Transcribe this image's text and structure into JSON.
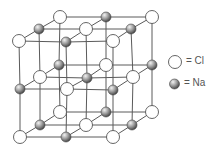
{
  "diagram": {
    "colors": {
      "line": "#555555",
      "cl_fill": "#ffffff",
      "cl_stroke": "#555555",
      "na_light": "#e8e8e8",
      "na_dark": "#555555"
    },
    "layers": [
      {
        "name": "top",
        "nodes": [
          {
            "x": 60,
            "y": 17,
            "type": "Cl"
          },
          {
            "x": 106,
            "y": 17,
            "type": "Na"
          },
          {
            "x": 152,
            "y": 17,
            "type": "Cl"
          },
          {
            "x": 39,
            "y": 29,
            "type": "Na"
          },
          {
            "x": 86,
            "y": 29,
            "type": "Cl"
          },
          {
            "x": 131,
            "y": 29,
            "type": "Na"
          },
          {
            "x": 19,
            "y": 41,
            "type": "Cl"
          },
          {
            "x": 66,
            "y": 42,
            "type": "Na"
          },
          {
            "x": 113,
            "y": 41,
            "type": "Cl"
          }
        ]
      },
      {
        "name": "middle",
        "nodes": [
          {
            "x": 59,
            "y": 65,
            "type": "Na"
          },
          {
            "x": 106,
            "y": 65,
            "type": "Cl"
          },
          {
            "x": 152,
            "y": 65,
            "type": "Na"
          },
          {
            "x": 40,
            "y": 77,
            "type": "Cl"
          },
          {
            "x": 87,
            "y": 78,
            "type": "Na"
          },
          {
            "x": 133,
            "y": 77,
            "type": "Cl"
          },
          {
            "x": 20,
            "y": 89,
            "type": "Na"
          },
          {
            "x": 67,
            "y": 89,
            "type": "Cl"
          },
          {
            "x": 113,
            "y": 90,
            "type": "Na"
          }
        ]
      },
      {
        "name": "bottom",
        "nodes": [
          {
            "x": 60,
            "y": 112,
            "type": "Cl"
          },
          {
            "x": 106,
            "y": 112,
            "type": "Na"
          },
          {
            "x": 152,
            "y": 112,
            "type": "Cl"
          },
          {
            "x": 40,
            "y": 125,
            "type": "Na"
          },
          {
            "x": 86,
            "y": 125,
            "type": "Cl"
          },
          {
            "x": 132,
            "y": 125,
            "type": "Na"
          },
          {
            "x": 20,
            "y": 137,
            "type": "Cl"
          },
          {
            "x": 66,
            "y": 137,
            "type": "Na"
          },
          {
            "x": 113,
            "y": 137,
            "type": "Cl"
          }
        ]
      }
    ]
  },
  "legend": {
    "items": [
      {
        "symbol": "white-circle",
        "label": "= Cl"
      },
      {
        "symbol": "gray-sphere",
        "label": "= Na"
      }
    ]
  }
}
